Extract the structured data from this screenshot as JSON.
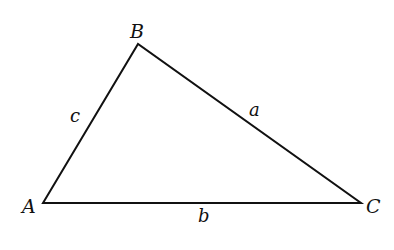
{
  "diagram": {
    "type": "triangle",
    "colors": {
      "stroke": "#111111",
      "background": "#ffffff"
    },
    "vertices": [
      {
        "id": "A",
        "label": "A",
        "x": 43,
        "y": 203
      },
      {
        "id": "B",
        "label": "B",
        "x": 138,
        "y": 44
      },
      {
        "id": "C",
        "label": "C",
        "x": 361,
        "y": 203
      }
    ],
    "sides": [
      {
        "id": "a",
        "label": "a",
        "from": "B",
        "to": "C"
      },
      {
        "id": "b",
        "label": "b",
        "from": "A",
        "to": "C"
      },
      {
        "id": "c",
        "label": "c",
        "from": "A",
        "to": "B"
      }
    ]
  }
}
